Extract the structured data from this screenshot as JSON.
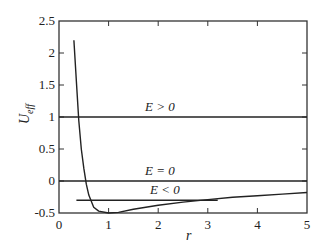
{
  "chart_data": {
    "type": "line",
    "title": "",
    "xlabel": "r",
    "ylabel": "U_eff",
    "xlim": [
      0,
      5
    ],
    "ylim": [
      -0.5,
      2.5
    ],
    "grid": false,
    "x_ticks": [
      0,
      1,
      2,
      3,
      4,
      5
    ],
    "x_tick_labels": [
      "0",
      "1",
      "2",
      "3",
      "4",
      "5"
    ],
    "y_ticks": [
      -0.5,
      0,
      0.5,
      1,
      1.5,
      2,
      2.5
    ],
    "y_tick_labels": [
      "-0.5",
      "0",
      "0.5",
      "1",
      "1.5",
      "2",
      "2.5"
    ],
    "series": [
      {
        "name": "U_eff(r)",
        "x": [
          0.3,
          0.35,
          0.4,
          0.45,
          0.5,
          0.55,
          0.6,
          0.7,
          0.8,
          1.0,
          1.2,
          1.5,
          2.0,
          2.5,
          3.0,
          3.5,
          4.0,
          4.5,
          5.0
        ],
        "y": [
          2.2,
          1.55,
          0.94,
          0.5,
          0.2,
          -0.05,
          -0.22,
          -0.41,
          -0.47,
          -0.5,
          -0.49,
          -0.44,
          -0.38,
          -0.33,
          -0.29,
          -0.255,
          -0.23,
          -0.205,
          -0.18
        ]
      },
      {
        "name": "E > 0",
        "x": [
          0,
          5
        ],
        "y": [
          1.0,
          1.0
        ]
      },
      {
        "name": "E = 0",
        "x": [
          0,
          5
        ],
        "y": [
          0.0,
          0.0
        ]
      },
      {
        "name": "E < 0",
        "x": [
          0.35,
          3.2
        ],
        "y": [
          -0.3,
          -0.3
        ]
      }
    ],
    "annotations": [
      {
        "text": "E > 0",
        "x": 1.7,
        "y": 1.08
      },
      {
        "text": "E = 0",
        "x": 1.7,
        "y": 0.08
      },
      {
        "text": "E < 0",
        "x": 1.75,
        "y": -0.2
      }
    ]
  },
  "labels": {
    "x_axis": "r",
    "y_axis_main": "U",
    "y_axis_sub": "eff",
    "ann_pos": "E > 0",
    "ann_zero": "E = 0",
    "ann_neg": "E < 0"
  }
}
